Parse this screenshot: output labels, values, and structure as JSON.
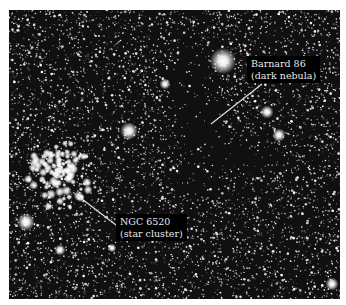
{
  "image": {
    "description": "Star field photograph showing dark nebula and open star cluster",
    "background_color": "#0a0a0a",
    "border_color": "#ffffff"
  },
  "labels": [
    {
      "id": "barnard-86",
      "line1": "Barnard 86",
      "line2": "(dark nebula)",
      "box": {
        "x": 247,
        "y": 56
      },
      "leader": {
        "x1": 262,
        "y1": 84,
        "x2": 211,
        "y2": 124
      }
    },
    {
      "id": "ngc-6520",
      "line1": "NGC 6520",
      "line2": "(star cluster)",
      "box": {
        "x": 116,
        "y": 214
      },
      "leader": {
        "x1": 78,
        "y1": 196,
        "x2": 116,
        "y2": 225
      }
    }
  ],
  "colors": {
    "label_bg": "#000000",
    "label_text": "#e8e8e8",
    "leader_line": "#e0e0e0",
    "stars": "#ffffff"
  }
}
